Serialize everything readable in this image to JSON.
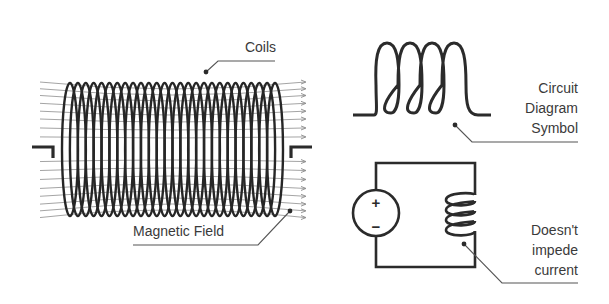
{
  "diagram": {
    "colors": {
      "background": "#ffffff",
      "ink": "#262626",
      "field_lines": "#9a9a9a",
      "label_text": "#3a3a3a",
      "leader_lines": "#555555"
    },
    "solenoid": {
      "label": "Coils",
      "field_label": "Magnetic Field",
      "turns": 27,
      "x_start": 62,
      "x_end": 283,
      "y_top": 83,
      "y_bottom": 216,
      "lead_left": {
        "x1": 32,
        "x2": 53,
        "y": 147
      },
      "lead_right": {
        "x1": 291,
        "x2": 312,
        "y": 147
      },
      "field_line_ys": [
        89,
        95,
        101,
        108,
        115,
        122,
        130,
        138,
        160,
        168,
        176,
        184,
        191,
        198,
        204,
        210
      ]
    },
    "circuit_symbol": {
      "label_lines": [
        "Circuit",
        "Diagram",
        "Symbol"
      ],
      "loops": 4,
      "baseline_y": 115,
      "x_start": 353,
      "x_end": 491,
      "loop_top": 43
    },
    "circuit": {
      "label_lines": [
        "Doesn't",
        "impede",
        "current"
      ],
      "source": {
        "type": "voltage-source",
        "plus": "+",
        "minus": "−"
      },
      "rect": {
        "left": 376,
        "right": 475,
        "top": 163,
        "bottom": 267
      },
      "inductor_loops": 4
    },
    "annotations": [
      {
        "id": "coils",
        "text": "Coils",
        "dot": [
          206,
          72
        ],
        "elbow": [
          218,
          61
        ],
        "end": [
          275,
          61
        ]
      },
      {
        "id": "magnetic-field",
        "text": "Magnetic Field",
        "dot": [
          290,
          211
        ],
        "elbow": [
          258,
          245
        ],
        "end": [
          133,
          245
        ]
      },
      {
        "id": "circuit-symbol",
        "dot": [
          455,
          125
        ],
        "elbow": [
          472,
          142
        ],
        "end": [
          578,
          142
        ]
      },
      {
        "id": "doesnt-impede",
        "dot": [
          464,
          244
        ],
        "elbow": [
          502,
          283
        ],
        "end": [
          578,
          283
        ]
      }
    ]
  }
}
